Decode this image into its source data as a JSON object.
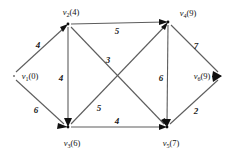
{
  "figure": {
    "background_color": "#ffffff",
    "edge_color": "#5d5d5d",
    "text_color": "#111111"
  },
  "nodes": [
    {
      "id": "v1",
      "label": "v",
      "subscript": "1",
      "value": "(0)",
      "full_label": "v1(0)",
      "x": 14,
      "y": 76,
      "label_x": 30,
      "label_y": 79,
      "anchor": "middle"
    },
    {
      "id": "v2",
      "label": "v",
      "subscript": "2",
      "value": "(4)",
      "full_label": "v2(4)",
      "x": 68,
      "y": 24,
      "label_x": 71,
      "label_y": 15,
      "anchor": "middle"
    },
    {
      "id": "v3",
      "label": "v",
      "subscript": "3",
      "value": "(6)",
      "full_label": "v3(6)",
      "x": 68,
      "y": 127,
      "label_x": 72,
      "label_y": 146,
      "anchor": "middle"
    },
    {
      "id": "v4",
      "label": "v",
      "subscript": "4",
      "value": "(9)",
      "full_label": "v4(9)",
      "x": 168,
      "y": 22,
      "label_x": 188,
      "label_y": 16,
      "anchor": "middle"
    },
    {
      "id": "v5",
      "label": "v",
      "subscript": "5",
      "value": "(7)",
      "full_label": "v5(7)",
      "x": 167,
      "y": 127,
      "label_x": 171,
      "label_y": 146,
      "anchor": "middle"
    },
    {
      "id": "v6",
      "label": "v",
      "subscript": "6",
      "value": "(9)",
      "full_label": "v6(9)",
      "x": 220,
      "y": 76,
      "label_x": 202,
      "label_y": 79,
      "anchor": "middle"
    }
  ],
  "edges": [
    {
      "id": "e1",
      "from": "v1",
      "to": "v2",
      "weight": "4",
      "wx": 38,
      "wy": 48
    },
    {
      "id": "e2",
      "from": "v1",
      "to": "v3",
      "weight": "6",
      "wx": 36,
      "wy": 113
    },
    {
      "id": "e3",
      "from": "v2",
      "to": "v4",
      "weight": "5",
      "wx": 117,
      "wy": 31
    },
    {
      "id": "e4",
      "from": "v2",
      "to": "v3",
      "weight": "4",
      "wx": 61,
      "wy": 78
    },
    {
      "id": "e5",
      "from": "v2",
      "to": "v5",
      "weight": "3",
      "wx": 108,
      "wy": 60
    },
    {
      "id": "e6",
      "from": "v3",
      "to": "v4",
      "weight": "5",
      "wx": 99,
      "wy": 108
    },
    {
      "id": "e7",
      "from": "v3",
      "to": "v5",
      "weight": "4",
      "wx": 117,
      "wy": 124
    },
    {
      "id": "e8",
      "from": "v4",
      "to": "v5",
      "weight": "6",
      "wx": 161,
      "wy": 78
    },
    {
      "id": "e9",
      "from": "v4",
      "to": "v6",
      "weight": "7",
      "wx": 196,
      "wy": 46
    },
    {
      "id": "e10",
      "from": "v5",
      "to": "v6",
      "weight": "2",
      "wx": 196,
      "wy": 111
    }
  ],
  "graph_data": {
    "type": "directed-weighted-graph",
    "node_count": 6,
    "edge_count": 10,
    "node_values": {
      "v1": 0,
      "v2": 4,
      "v3": 6,
      "v4": 9,
      "v5": 7,
      "v6": 9
    },
    "edge_weights": {
      "v1-v2": 4,
      "v1-v3": 6,
      "v2-v4": 5,
      "v2-v3": 4,
      "v2-v5": 3,
      "v3-v4": 5,
      "v3-v5": 4,
      "v4-v5": 6,
      "v4-v6": 7,
      "v5-v6": 2
    }
  }
}
